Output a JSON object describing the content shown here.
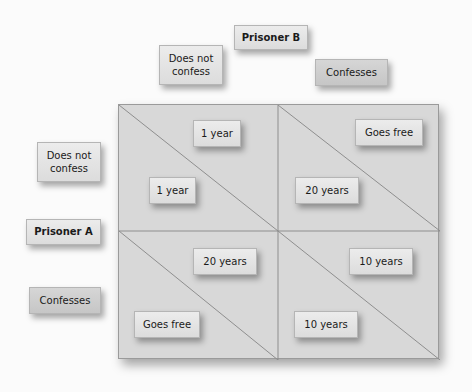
{
  "player_b": {
    "title": "Prisoner B",
    "does_not_confess": "Does not confess",
    "confesses": "Confesses"
  },
  "player_a": {
    "title": "Prisoner A",
    "does_not_confess": "Does not confess",
    "confesses": "Confesses"
  },
  "payoffs": {
    "nc_nc": {
      "b": "1 year",
      "a": "1 year"
    },
    "nc_c": {
      "b": "Goes free",
      "a": "20 years"
    },
    "c_nc": {
      "b": "20 years",
      "a": "Goes free"
    },
    "c_c": {
      "b": "10 years",
      "a": "10 years"
    }
  }
}
